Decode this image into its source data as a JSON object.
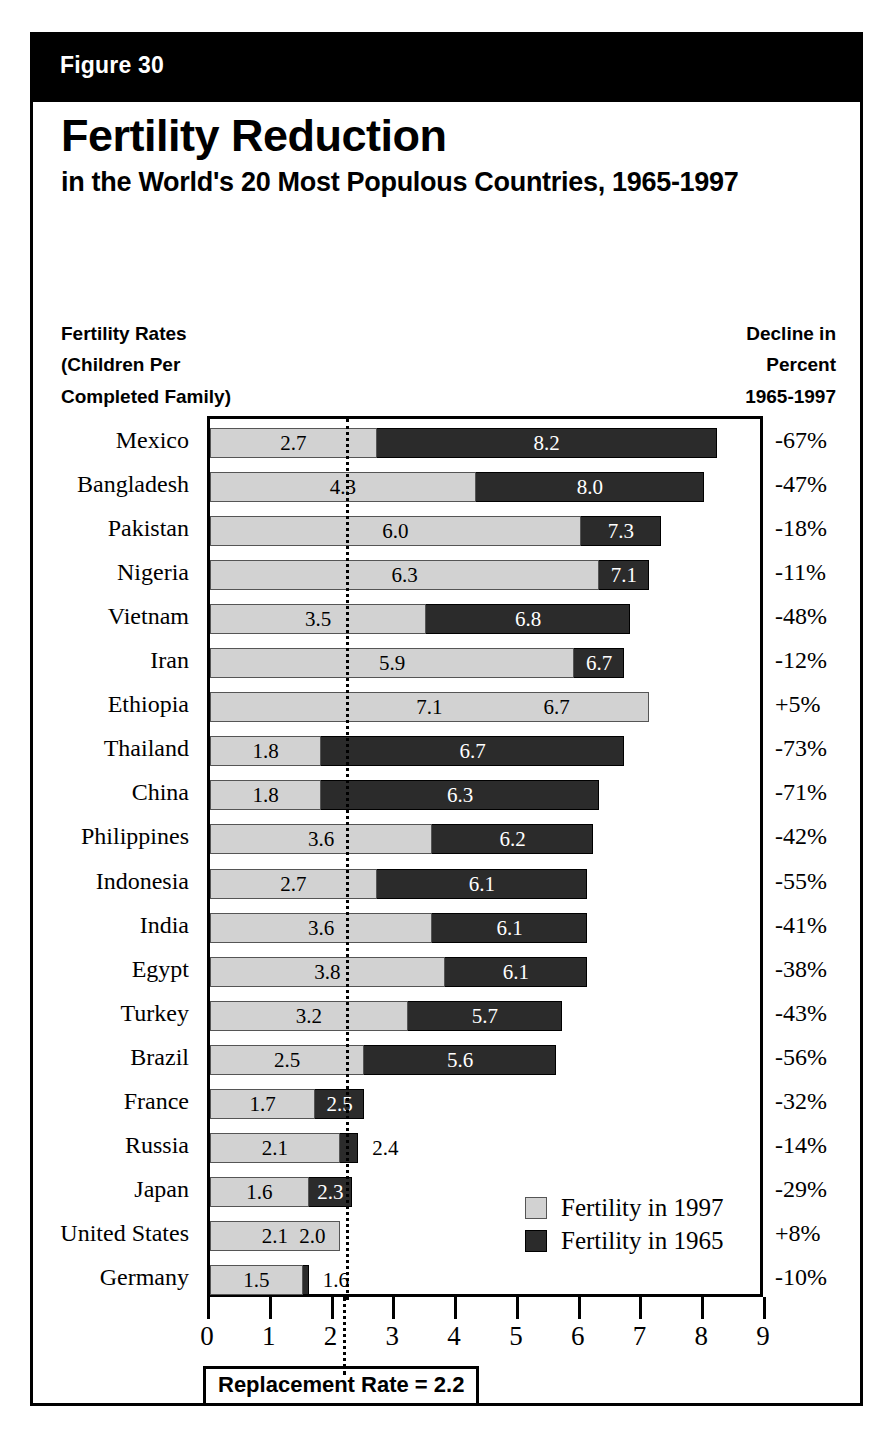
{
  "figure": {
    "number_label": "Figure 30",
    "title": "Fertility Reduction",
    "subtitle": "in the World's 20 Most Populous Countries, 1965-1997",
    "caption_left": "Fertility Rates\n(Children Per\nCompleted Family)",
    "caption_right": "Decline in\nPercent\n1965-1997",
    "replacement_note": "Replacement Rate = 2.2"
  },
  "colors": {
    "fertility_1997": "#d2d2d2",
    "fertility_1965": "#2b2b2b",
    "frame": "#000000",
    "header_bar": "#000000",
    "header_text": "#ffffff"
  },
  "legend": {
    "position": "inside-bottom-right",
    "entries": [
      {
        "label": "Fertility in 1997",
        "color": "#d2d2d2"
      },
      {
        "label": "Fertility in 1965",
        "color": "#2b2b2b"
      }
    ]
  },
  "chart_data": {
    "type": "bar",
    "orientation": "horizontal",
    "overlay": "overlapping-bars",
    "title": "Fertility Reduction in the World's 20 Most Populous Countries, 1965-1997",
    "xlabel": "Fertility Rates (Children Per Completed Family)",
    "ylabel": "",
    "xlim": [
      0,
      9
    ],
    "xticks": [
      0,
      1,
      2,
      3,
      4,
      5,
      6,
      7,
      8,
      9
    ],
    "xtick_labels": [
      "0",
      "1",
      "2",
      "3",
      "4",
      "5",
      "6",
      "7",
      "8",
      "9"
    ],
    "grid": false,
    "reference_line": {
      "value": 2.2,
      "label": "Replacement Rate = 2.2",
      "style": "dotted"
    },
    "categories": [
      "Mexico",
      "Bangladesh",
      "Pakistan",
      "Nigeria",
      "Vietnam",
      "Iran",
      "Ethiopia",
      "Thailand",
      "China",
      "Philippines",
      "Indonesia",
      "India",
      "Egypt",
      "Turkey",
      "Brazil",
      "France",
      "Russia",
      "Japan",
      "United States",
      "Germany"
    ],
    "series": [
      {
        "name": "Fertility in 1997",
        "color": "#d2d2d2",
        "values": [
          2.7,
          4.3,
          6.0,
          6.3,
          3.5,
          5.9,
          7.1,
          1.8,
          1.8,
          3.6,
          2.7,
          3.6,
          3.8,
          3.2,
          2.5,
          1.7,
          2.1,
          1.6,
          2.1,
          1.5
        ]
      },
      {
        "name": "Fertility in 1965",
        "color": "#2b2b2b",
        "values": [
          8.2,
          8.0,
          7.3,
          7.1,
          6.8,
          6.7,
          6.7,
          6.7,
          6.3,
          6.2,
          6.1,
          6.1,
          6.1,
          5.7,
          5.6,
          2.5,
          2.4,
          2.3,
          2.0,
          1.6
        ]
      }
    ],
    "annotations_right_column": {
      "header": "Decline in Percent 1965-1997",
      "values": [
        "-67%",
        "-47%",
        "-18%",
        "-11%",
        "-48%",
        "-12%",
        "+5%",
        "-73%",
        "-71%",
        "-42%",
        "-55%",
        "-41%",
        "-38%",
        "-43%",
        "-56%",
        "-32%",
        "-14%",
        "-29%",
        "+8%",
        "-10%"
      ]
    },
    "value_labels_1997": [
      "2.7",
      "4.3",
      "6.0",
      "6.3",
      "3.5",
      "5.9",
      "7.1",
      "1.8",
      "1.8",
      "3.6",
      "2.7",
      "3.6",
      "3.8",
      "3.2",
      "2.5",
      "1.7",
      "2.1",
      "1.6",
      "2.1",
      "1.5"
    ],
    "value_labels_1965": [
      "8.2",
      "8.0",
      "7.3",
      "7.1",
      "6.8",
      "6.7",
      "6.7",
      "6.7",
      "6.3",
      "6.2",
      "6.1",
      "6.1",
      "6.1",
      "5.7",
      "5.6",
      "2.5",
      "2.4",
      "2.3",
      "2.0",
      "1.6"
    ]
  }
}
